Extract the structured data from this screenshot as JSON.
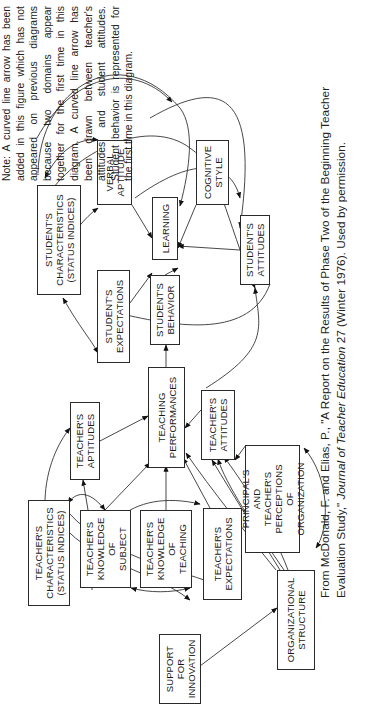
{
  "orientation": "rotated-90-ccw",
  "note": {
    "text": "Note: A curved line arrow has been added in this figure which has not appeared on previous diagrams because two domains appear together for the first time in this diagram. A curved line arrow has been drawn between teacher's attitudes and student attitudes. Student behavior is represented for the first time in this diagram."
  },
  "citation": {
    "prefix": "From McDonald, F. and Elias, P., \"A Report on the Results of Phase Two of the Beginning Teacher Evaluation Study,\" ",
    "journal": "Journal of Teacher Education",
    "suffix": " 27 (Winter 1976). Used by permission."
  },
  "boxes": {
    "students_characteristics": "Student's\nCharacteristics\n(Status Indices)",
    "verbal_aptitude": "Verbal\nAptitude",
    "learning": "Learning",
    "cognitive_style": "Cognitive\nStyle",
    "students_attitudes": "Student's\nAttitudes",
    "students_expectations": "Student's\nExpectations",
    "students_behavior": "Student's\nBehavior",
    "teaching_performances": "Teaching\nPerformances",
    "teachers_aptitudes": "Teacher's\nAptitudes",
    "teachers_attitudes": "Teacher's\nAttitudes",
    "principals_perceptions": "Principal's\nand\nTeacher's\nPerceptions\nof\nOrganization",
    "teachers_characteristics": "Teacher's\nCharacteristics\n(Status Indices)",
    "teachers_knowledge_subject": "Teacher's\nKnowledge\nof\nSubject",
    "teachers_knowledge_teaching": "Teacher's\nKnowledge\nof\nTeaching",
    "teachers_expectations": "Teacher's\nExpectations",
    "support_for_innovation": "Support\nfor\nInnovation",
    "organizational_structure": "Organizational\nStructure"
  },
  "edges": [
    {
      "from": "verbal_aptitude",
      "to": "learning"
    },
    {
      "from": "cognitive_style",
      "to": "learning"
    },
    {
      "from": "students_attitudes",
      "to": "learning"
    },
    {
      "from": "students_expectations",
      "to": "learning"
    },
    {
      "from": "students_behavior",
      "to": "learning"
    },
    {
      "from": "teaching_performances",
      "to": "students_behavior"
    },
    {
      "from": "teachers_aptitudes",
      "to": "teaching_performances"
    },
    {
      "from": "teachers_attitudes",
      "to": "teaching_performances"
    },
    {
      "from": "teachers_knowledge_subject",
      "to": "teaching_performances"
    },
    {
      "from": "teachers_knowledge_subject",
      "to": "teachers_aptitudes"
    },
    {
      "from": "teachers_knowledge_teaching",
      "to": "teaching_performances"
    },
    {
      "from": "teachers_expectations",
      "to": "teaching_performances"
    },
    {
      "from": "teachers_characteristics",
      "to": "teachers_aptitudes"
    },
    {
      "from": "principals_perceptions",
      "to": "teachers_attitudes"
    },
    {
      "from": "organizational_structure",
      "to": "teachers_attitudes"
    },
    {
      "from": "organizational_structure",
      "to": "teaching_performances"
    },
    {
      "from": "support_for_innovation",
      "to": "organizational_structure"
    },
    {
      "from": "organizational_structure",
      "to": "principals_perceptions",
      "bidirectional": true
    },
    {
      "from": "teachers_attitudes",
      "to": "students_attitudes",
      "curved": true
    },
    {
      "from": "students_characteristics",
      "to": "verbal_aptitude",
      "bidirectional": true
    },
    {
      "from": "students_characteristics",
      "to": "students_expectations",
      "bidirectional": true
    },
    {
      "from": "verbal_aptitude",
      "to": "students_expectations",
      "bidirectional": true
    },
    {
      "from": "teachers_characteristics",
      "to": "teachers_knowledge_subject",
      "bidirectional": true
    },
    {
      "from": "teachers_knowledge_subject",
      "to": "teachers_knowledge_teaching",
      "bidirectional": true
    }
  ]
}
